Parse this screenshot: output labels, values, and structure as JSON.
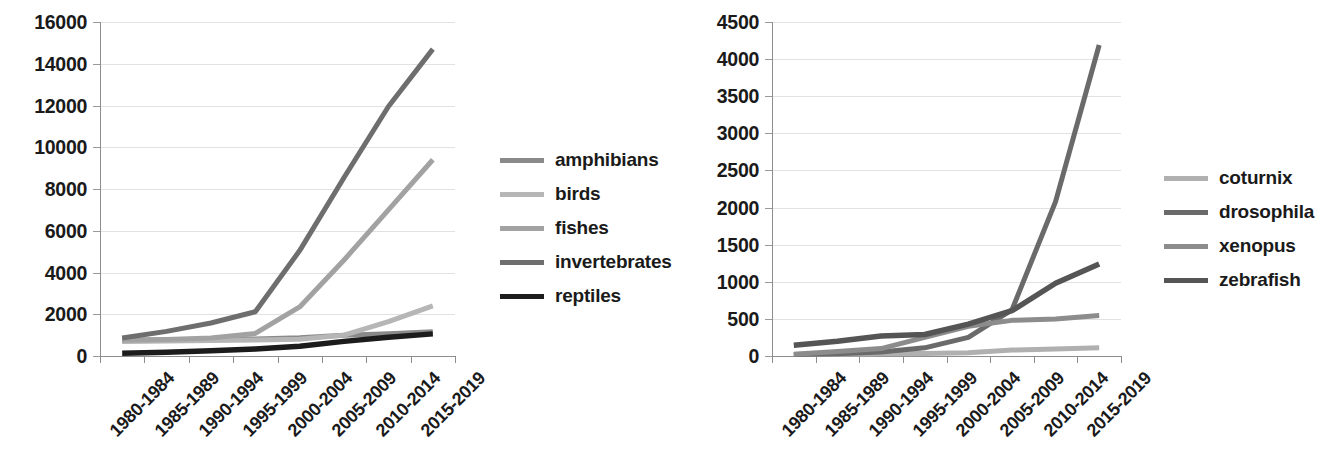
{
  "chart_data": [
    {
      "panel": "left",
      "type": "line",
      "title": "",
      "xlabel": "",
      "ylabel": "",
      "categories": [
        "1980-1984",
        "1985-1989",
        "1990-1994",
        "1995-1999",
        "2000-2004",
        "2005-2009",
        "2010-2014",
        "2015-2019"
      ],
      "ylim": [
        0,
        16000
      ],
      "ytick_labels": [
        "0",
        "2000",
        "4000",
        "6000",
        "8000",
        "10000",
        "12000",
        "14000",
        "16000"
      ],
      "ytick_values": [
        0,
        2000,
        4000,
        6000,
        8000,
        10000,
        12000,
        14000,
        16000
      ],
      "grid": true,
      "legend_position": "right",
      "series": [
        {
          "name": "amphibians",
          "color": "#8a8a8a",
          "width": 5.0,
          "values": [
            760,
            780,
            800,
            820,
            870,
            1000,
            1060,
            1160
          ]
        },
        {
          "name": "birds",
          "color": "#b6b6b6",
          "width": 5.0,
          "values": [
            700,
            720,
            740,
            770,
            800,
            1000,
            1650,
            2400
          ]
        },
        {
          "name": "fishes",
          "color": "#a2a2a2",
          "width": 5.0,
          "values": [
            760,
            790,
            860,
            1080,
            2350,
            4600,
            7000,
            9400
          ]
        },
        {
          "name": "invertebrates",
          "color": "#6e6e6e",
          "width": 5.0,
          "values": [
            860,
            1180,
            1580,
            2120,
            5050,
            8550,
            11950,
            14700
          ]
        },
        {
          "name": "reptiles",
          "color": "#1c1c1c",
          "width": 5.5,
          "values": [
            130,
            180,
            250,
            340,
            470,
            700,
            900,
            1060
          ]
        }
      ]
    },
    {
      "panel": "right",
      "type": "line",
      "title": "",
      "xlabel": "",
      "ylabel": "",
      "categories": [
        "1980-1984",
        "1985-1989",
        "1990-1994",
        "1995-1999",
        "2000-2004",
        "2005-2009",
        "2010-2014",
        "2015-2019"
      ],
      "ylim": [
        0,
        4500
      ],
      "ytick_labels": [
        "0",
        "500",
        "1000",
        "1500",
        "2000",
        "2500",
        "3000",
        "3500",
        "4000",
        "4500"
      ],
      "ytick_values": [
        0,
        500,
        1000,
        1500,
        2000,
        2500,
        3000,
        3500,
        4000,
        4500
      ],
      "grid": true,
      "legend_position": "right",
      "series": [
        {
          "name": "coturnix",
          "color": "#b0b0b0",
          "width": 5.0,
          "values": [
            20,
            25,
            30,
            35,
            45,
            80,
            95,
            110
          ]
        },
        {
          "name": "drosophila",
          "color": "#6a6a6a",
          "width": 5.0,
          "values": [
            20,
            30,
            55,
            110,
            250,
            620,
            2080,
            4190
          ]
        },
        {
          "name": "xenopus",
          "color": "#8c8c8c",
          "width": 5.0,
          "values": [
            25,
            60,
            100,
            250,
            400,
            480,
            500,
            545
          ]
        },
        {
          "name": "zebrafish",
          "color": "#555555",
          "width": 5.5,
          "values": [
            145,
            200,
            270,
            290,
            430,
            610,
            980,
            1240
          ]
        }
      ]
    }
  ],
  "left_chart": {
    "legend": {
      "items": [
        {
          "label": "amphibians"
        },
        {
          "label": "birds"
        },
        {
          "label": "fishes"
        },
        {
          "label": "invertebrates"
        },
        {
          "label": "reptiles"
        }
      ]
    },
    "y_axis": {
      "labels": [
        "16000",
        "14000",
        "12000",
        "10000",
        "8000",
        "6000",
        "4000",
        "2000",
        "0"
      ]
    },
    "x_axis": {
      "labels": [
        "1980-1984",
        "1985-1989",
        "1990-1994",
        "1995-1999",
        "2000-2004",
        "2005-2009",
        "2010-2014",
        "2015-2019"
      ]
    }
  },
  "right_chart": {
    "legend": {
      "items": [
        {
          "label": "coturnix"
        },
        {
          "label": "drosophila"
        },
        {
          "label": "xenopus"
        },
        {
          "label": "zebrafish"
        }
      ]
    },
    "y_axis": {
      "labels": [
        "4500",
        "4000",
        "3500",
        "3000",
        "2500",
        "2000",
        "1500",
        "1000",
        "500",
        "0"
      ]
    },
    "x_axis": {
      "labels": [
        "1980-1984",
        "1985-1989",
        "1990-1994",
        "1995-1999",
        "2000-2004",
        "2005-2009",
        "2010-2014",
        "2015-2019"
      ]
    }
  }
}
